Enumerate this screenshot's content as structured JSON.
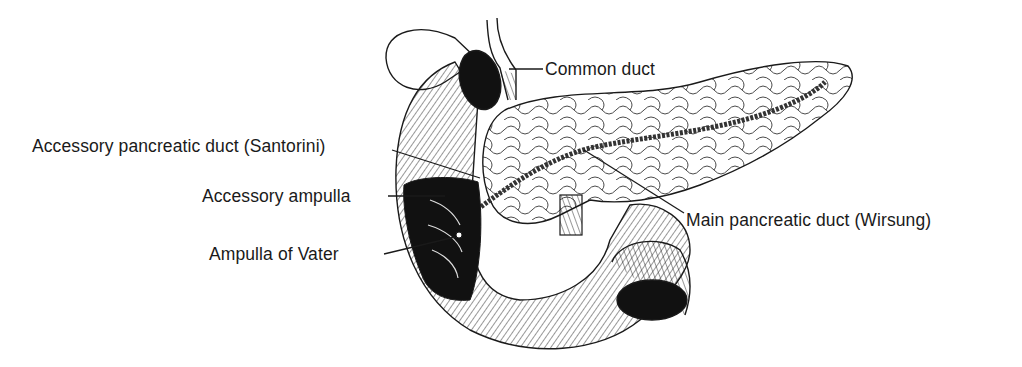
{
  "figure": {
    "style": "black-and-white line illustration",
    "colors": {
      "ink": "#1a1a1a",
      "background": "#ffffff"
    }
  },
  "labels": {
    "common_duct": "Common duct",
    "accessory_duct": "Accessory pancreatic duct (Santorini)",
    "accessory_ampulla": "Accessory ampulla",
    "ampulla_vater": "Ampulla of Vater",
    "main_duct": "Main pancreatic duct (Wirsung)"
  }
}
